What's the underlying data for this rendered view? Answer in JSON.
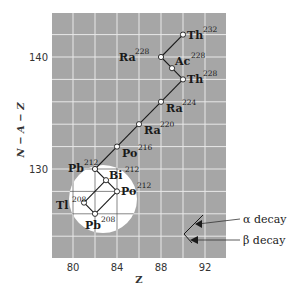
{
  "colors": {
    "plot_bg": "#a6a6a6",
    "grid": "#e8e8e8",
    "highlight": "#ffffff",
    "line": "#1a1a1a"
  },
  "axes": {
    "x_label": "Z",
    "y_label": "N − A − Z",
    "x_ticks": [
      {
        "value": 80,
        "label": "80"
      },
      {
        "value": 84,
        "label": "84"
      },
      {
        "value": 88,
        "label": "88"
      },
      {
        "value": 92,
        "label": "92"
      }
    ],
    "y_ticks": [
      {
        "value": 130,
        "label": "130"
      },
      {
        "value": 140,
        "label": "140"
      }
    ],
    "x_range": [
      78,
      94
    ],
    "y_range": [
      122,
      143.5
    ]
  },
  "nuclides": [
    {
      "id": "th232",
      "symbol": "Th",
      "mass": "232",
      "z": 90,
      "n": 142,
      "label_side": "right"
    },
    {
      "id": "ra228",
      "symbol": "Ra",
      "mass": "228",
      "z": 88,
      "n": 140,
      "label_side": "left"
    },
    {
      "id": "ac228",
      "symbol": "Ac",
      "mass": "228",
      "z": 89,
      "n": 139,
      "label_side": "right"
    },
    {
      "id": "th228",
      "symbol": "Th",
      "mass": "228",
      "z": 90,
      "n": 138,
      "label_side": "right"
    },
    {
      "id": "ra224",
      "symbol": "Ra",
      "mass": "224",
      "z": 88,
      "n": 136,
      "label_side": "right-below"
    },
    {
      "id": "ra220",
      "symbol": "Ra",
      "mass": "220",
      "z": 86,
      "n": 134,
      "label_side": "right-below"
    },
    {
      "id": "po216",
      "symbol": "Po",
      "mass": "216",
      "z": 84,
      "n": 132,
      "label_side": "right-below"
    },
    {
      "id": "pb212",
      "symbol": "Pb",
      "mass": "212",
      "z": 82,
      "n": 130,
      "label_side": "left"
    },
    {
      "id": "bi212",
      "symbol": "Bi",
      "mass": "212",
      "z": 83,
      "n": 129,
      "label_side": "right"
    },
    {
      "id": "po212",
      "symbol": "Po",
      "mass": "212",
      "z": 84,
      "n": 128,
      "label_side": "right"
    },
    {
      "id": "tl208",
      "symbol": "Tl",
      "mass": "208",
      "z": 81,
      "n": 127,
      "label_side": "left"
    },
    {
      "id": "pb208",
      "symbol": "Pb",
      "mass": "208",
      "z": 82,
      "n": 126,
      "label_side": "below"
    }
  ],
  "decays": [
    {
      "from": "th232",
      "to": "ra228",
      "type": "alpha"
    },
    {
      "from": "ra228",
      "to": "ac228",
      "type": "beta"
    },
    {
      "from": "ac228",
      "to": "th228",
      "type": "beta"
    },
    {
      "from": "th228",
      "to": "ra224",
      "type": "alpha"
    },
    {
      "from": "ra224",
      "to": "ra220",
      "type": "alpha"
    },
    {
      "from": "ra220",
      "to": "po216",
      "type": "alpha"
    },
    {
      "from": "po216",
      "to": "pb212",
      "type": "alpha"
    },
    {
      "from": "pb212",
      "to": "bi212",
      "type": "beta"
    },
    {
      "from": "bi212",
      "to": "po212",
      "type": "beta"
    },
    {
      "from": "bi212",
      "to": "tl208",
      "type": "alpha"
    },
    {
      "from": "po212",
      "to": "pb208",
      "type": "alpha"
    },
    {
      "from": "tl208",
      "to": "pb208",
      "type": "beta"
    }
  ],
  "legend": {
    "alpha_label": "α decay",
    "beta_label": "β decay"
  }
}
